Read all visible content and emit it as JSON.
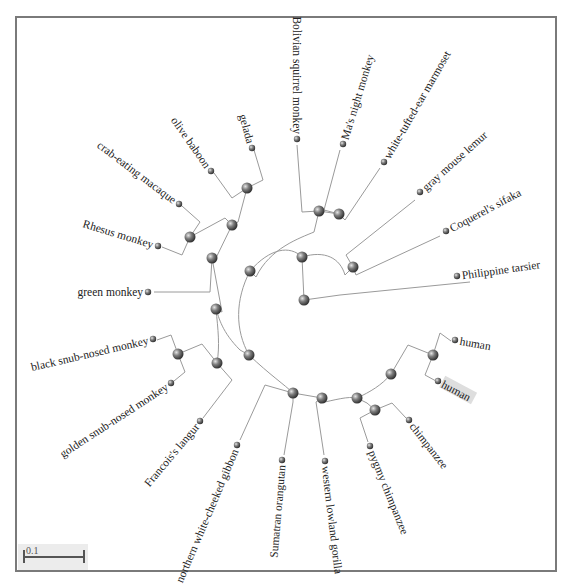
{
  "viewer": {
    "scale_bar": {
      "label": "0.1",
      "length_px": 61
    },
    "selected_leaf": "human_2"
  },
  "tree": {
    "root": {
      "id": "root",
      "x": 304,
      "y": 300
    },
    "internal_nodes": [
      {
        "id": "n_primates",
        "x": 302,
        "y": 257
      },
      {
        "id": "n_strep",
        "x": 353,
        "y": 267
      },
      {
        "id": "n_anthropoid",
        "x": 250,
        "y": 271
      },
      {
        "id": "n_platy",
        "x": 319,
        "y": 211
      },
      {
        "id": "n_aotus_calli",
        "x": 339,
        "y": 214
      },
      {
        "id": "n_catarrhini",
        "x": 249,
        "y": 355
      },
      {
        "id": "n_owm",
        "x": 216,
        "y": 309
      },
      {
        "id": "n_cercopithecinae",
        "x": 212,
        "y": 258
      },
      {
        "id": "n_papionini",
        "x": 232,
        "y": 225
      },
      {
        "id": "n_baboon_gelada",
        "x": 247,
        "y": 188
      },
      {
        "id": "n_macaca",
        "x": 190,
        "y": 237
      },
      {
        "id": "n_colobinae",
        "x": 217,
        "y": 363
      },
      {
        "id": "n_rhinopithecus",
        "x": 178,
        "y": 354
      },
      {
        "id": "n_hominoidea",
        "x": 293,
        "y": 393
      },
      {
        "id": "n_hominidae",
        "x": 322,
        "y": 398
      },
      {
        "id": "n_homininae",
        "x": 357,
        "y": 398
      },
      {
        "id": "n_homo_pan",
        "x": 391,
        "y": 374
      },
      {
        "id": "n_homo",
        "x": 433,
        "y": 355
      },
      {
        "id": "n_pan",
        "x": 375,
        "y": 410
      }
    ],
    "leaves": [
      {
        "id": "tarsier",
        "label": "Philippine tarsier",
        "x": 457,
        "y": 276,
        "angle": -8,
        "anchor": "start"
      },
      {
        "id": "sifaka",
        "label": "Coquerel's sifaka",
        "x": 446,
        "y": 231,
        "angle": -28,
        "anchor": "start"
      },
      {
        "id": "mouse_lemur",
        "label": "gray mouse lemur",
        "x": 420,
        "y": 192,
        "angle": -42,
        "anchor": "start"
      },
      {
        "id": "marmoset",
        "label": "white-tufted-ear marmoset",
        "x": 384,
        "y": 162,
        "angle": -60,
        "anchor": "start"
      },
      {
        "id": "night_monkey",
        "label": "Ma's night monkey",
        "x": 343,
        "y": 144,
        "angle": -73,
        "anchor": "start"
      },
      {
        "id": "squirrel_monkey",
        "label": "Bolivian squirrel monkey",
        "x": 297,
        "y": 139,
        "angle": 90,
        "anchor": "end"
      },
      {
        "id": "gelada",
        "label": "gelada",
        "x": 252,
        "y": 148,
        "angle": 75,
        "anchor": "end"
      },
      {
        "id": "olive_baboon",
        "label": "olive baboon",
        "x": 211,
        "y": 171,
        "angle": 55,
        "anchor": "end"
      },
      {
        "id": "crab_macaque",
        "label": "crab-eating macaque",
        "x": 179,
        "y": 204,
        "angle": 37,
        "anchor": "end"
      },
      {
        "id": "rhesus",
        "label": "Rhesus monkey",
        "x": 158,
        "y": 246,
        "angle": 17,
        "anchor": "end"
      },
      {
        "id": "green_monkey",
        "label": "green monkey",
        "x": 148,
        "y": 292,
        "angle": 0,
        "anchor": "end"
      },
      {
        "id": "black_snub",
        "label": "black snub-nosed monkey",
        "x": 153,
        "y": 339,
        "angle": -13,
        "anchor": "end"
      },
      {
        "id": "golden_snub",
        "label": "golden snub-nosed monkey",
        "x": 171,
        "y": 383,
        "angle": -33,
        "anchor": "end"
      },
      {
        "id": "langur",
        "label": "Francois's langur",
        "x": 200,
        "y": 421,
        "angle": -50,
        "anchor": "end"
      },
      {
        "id": "gibbon",
        "label": "northern white-cheeked gibbon",
        "x": 237,
        "y": 445,
        "angle": -67,
        "anchor": "end"
      },
      {
        "id": "orangutan",
        "label": "Sumatran orangutan",
        "x": 282,
        "y": 460,
        "angle": -85,
        "anchor": "end"
      },
      {
        "id": "gorilla",
        "label": "western lowland gorilla",
        "x": 325,
        "y": 461,
        "angle": 83,
        "anchor": "start"
      },
      {
        "id": "bonobo",
        "label": "pygmy chimpanzee",
        "x": 370,
        "y": 446,
        "angle": 68,
        "anchor": "start"
      },
      {
        "id": "chimp",
        "label": "chimpanzee",
        "x": 409,
        "y": 420,
        "angle": 52,
        "anchor": "start"
      },
      {
        "id": "human_1",
        "label": "human",
        "x": 455,
        "y": 340,
        "angle": 10,
        "anchor": "start"
      },
      {
        "id": "human_2",
        "label": "human",
        "x": 438,
        "y": 381,
        "angle": 28,
        "anchor": "start"
      }
    ],
    "edges": [
      "M304,300 L302,257",
      "M304,300 L340,295 L470,282",
      "M250,271 C270,248 290,245 302,257 C325,250 340,258 345,275 L353,267",
      "M353,267 L346,255 L415,200",
      "M353,267 L356,275 L440,236",
      "M250,271 C235,300 235,330 249,355",
      "M250,271 L256,277 C270,248 300,238 314,232 L319,211",
      "M319,211 L302,212 L297,145",
      "M319,211 L339,214",
      "M339,214 L324,210 L340,150",
      "M339,214 L345,220 L380,168",
      "M249,355 L240,350 C222,332 219,318 216,309",
      "M249,355 C270,375 285,385 293,393",
      "M216,309 L222,312 L212,258",
      "M216,309 C218,330 220,345 217,363",
      "M212,258 L215,260 L232,225",
      "M212,258 L210,292 L154,292",
      "M232,225 L238,222 L247,188",
      "M232,225 L225,218 L190,237",
      "M247,188 L263,180 L254,150",
      "M247,188 L232,198 L214,173",
      "M190,237 L200,222 L182,206",
      "M190,237 L182,255 L162,247",
      "M217,363 L202,344 L178,354",
      "M217,363 L232,380 L203,418",
      "M178,354 L171,335 L157,340",
      "M178,354 L185,372 L174,381",
      "M293,393 L265,385 L240,440",
      "M293,393 L322,398",
      "M293,393 L293,402 L284,455",
      "M322,398 L320,403 C335,400 348,396 357,398",
      "M322,398 L316,402 L324,455",
      "M357,398 C370,392 382,385 391,374",
      "M357,398 L367,403 L375,410",
      "M391,374 L408,345 L433,355",
      "M433,355 L440,333 L451,341",
      "M433,355 L425,375 L436,381",
      "M375,410 L360,418 L368,442",
      "M375,410 L392,403 L406,418"
    ],
    "colors": {
      "branch": "#9a9a9a",
      "node_fill": "#6b6b6b",
      "node_highlight": "#d8d8d8",
      "selected_bg": "#dedede"
    }
  }
}
